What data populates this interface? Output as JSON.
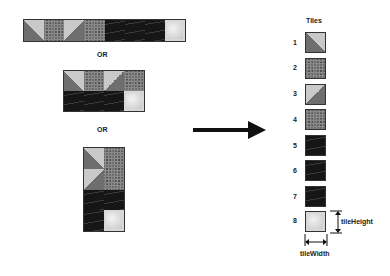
{
  "labels": {
    "or_1": "OR",
    "or_2": "OR",
    "tiles_title": "Tiles",
    "tile_height": "tileHeight",
    "tile_width": "tileWidth"
  },
  "tiles": [
    {
      "n": "1",
      "kind": "sky-rock-diagonal-left"
    },
    {
      "n": "2",
      "kind": "rock"
    },
    {
      "n": "3",
      "kind": "sky-rock-diagonal-right"
    },
    {
      "n": "4",
      "kind": "rock"
    },
    {
      "n": "5",
      "kind": "dark"
    },
    {
      "n": "6",
      "kind": "dark"
    },
    {
      "n": "7",
      "kind": "dark"
    },
    {
      "n": "8",
      "kind": "glass"
    }
  ],
  "layouts": [
    "8x1 horizontal strip",
    "4x2 grid",
    "2x4 grid"
  ],
  "colors": {
    "sky": "#c9c9c9",
    "rock": "#6e6e6e",
    "dark": "#161616",
    "glass": "#dcdcdc",
    "arrow": "#111111"
  }
}
